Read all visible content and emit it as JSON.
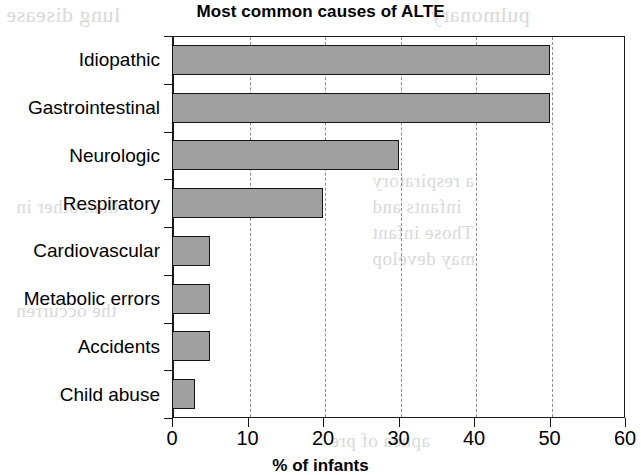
{
  "chart_data": {
    "type": "bar",
    "orientation": "horizontal",
    "title": "Most common causes of ALTE",
    "xlabel": "% of infants",
    "ylabel": "",
    "categories": [
      "Idiopathic",
      "Gastrointestinal",
      "Neurologic",
      "Respiratory",
      "Cardiovascular",
      "Metabolic errors",
      "Accidents",
      "Child abuse"
    ],
    "values": [
      50,
      50,
      30,
      20,
      5,
      5,
      5,
      3
    ],
    "xlim": [
      0,
      60
    ],
    "xticks": [
      0,
      10,
      20,
      30,
      40,
      50,
      60
    ],
    "xtick_labels": [
      "0",
      "10",
      "20",
      "30",
      "40",
      "50",
      "60"
    ],
    "grid": "vertical-dashed",
    "legend": null,
    "bar_fill_color": "#a0a0a0",
    "bar_edge_color": "#141414",
    "axis_color": "#1a1a1a",
    "gridline_color": "#8d8d8d"
  },
  "artifacts": {
    "bleed_text": [
      "lung disease",
      "pulmonary",
      "a respiratory",
      "infants and",
      "Those infant",
      "may develop",
      "than other in",
      "the occurren",
      "apnea of pre",
      "Several stud",
      "and the risk"
    ]
  }
}
